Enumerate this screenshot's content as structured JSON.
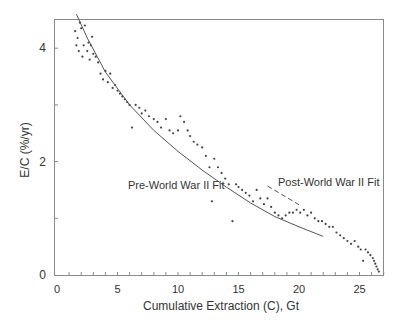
{
  "chart_data": {
    "type": "scatter",
    "title": "",
    "xlabel": "Cumulative Extraction (C), Gt",
    "ylabel": "E/C (%/yr)",
    "xlim": [
      0,
      27.3
    ],
    "ylim": [
      0,
      4.5
    ],
    "x_ticks": [
      0,
      5,
      10,
      15,
      20,
      25
    ],
    "x_tick_labels": [
      "0",
      "5",
      "10",
      "15",
      "20",
      "25"
    ],
    "y_ticks": [
      0,
      2,
      4
    ],
    "y_tick_labels": [
      "0",
      "2",
      "4"
    ],
    "grid": false,
    "legend": null,
    "annotations": [
      {
        "text": "Pre-World War II Fit",
        "x": 11.5,
        "y": 1.97
      },
      {
        "text": "Post-World War II Fit",
        "x": 21.0,
        "y": 1.55
      }
    ],
    "series": [
      {
        "name": "Observed E/C",
        "kind": "scatter",
        "points": [
          [
            1.5,
            4.3
          ],
          [
            1.6,
            4.05
          ],
          [
            1.7,
            4.18
          ],
          [
            1.8,
            3.95
          ],
          [
            1.9,
            4.45
          ],
          [
            2.0,
            4.35
          ],
          [
            2.1,
            3.85
          ],
          [
            2.2,
            4.05
          ],
          [
            2.3,
            4.4
          ],
          [
            2.5,
            3.95
          ],
          [
            2.6,
            4.1
          ],
          [
            2.7,
            3.8
          ],
          [
            2.8,
            4.05
          ],
          [
            2.9,
            4.2
          ],
          [
            3.0,
            3.9
          ],
          [
            3.2,
            3.85
          ],
          [
            3.4,
            3.75
          ],
          [
            3.6,
            3.55
          ],
          [
            3.8,
            3.45
          ],
          [
            4.0,
            3.6
          ],
          [
            4.2,
            3.4
          ],
          [
            4.4,
            3.55
          ],
          [
            4.6,
            3.3
          ],
          [
            4.8,
            3.35
          ],
          [
            5.0,
            3.25
          ],
          [
            5.2,
            3.2
          ],
          [
            5.4,
            3.15
          ],
          [
            5.6,
            3.1
          ],
          [
            5.8,
            3.05
          ],
          [
            6.0,
            3.0
          ],
          [
            6.2,
            2.6
          ],
          [
            6.5,
            3.0
          ],
          [
            6.8,
            2.95
          ],
          [
            7.0,
            2.85
          ],
          [
            7.3,
            2.9
          ],
          [
            7.6,
            2.8
          ],
          [
            8.0,
            2.75
          ],
          [
            8.3,
            2.7
          ],
          [
            8.6,
            2.6
          ],
          [
            9.0,
            2.75
          ],
          [
            9.3,
            2.55
          ],
          [
            9.6,
            2.5
          ],
          [
            10.0,
            2.55
          ],
          [
            10.2,
            2.8
          ],
          [
            10.5,
            2.7
          ],
          [
            10.8,
            2.55
          ],
          [
            11.0,
            2.45
          ],
          [
            11.3,
            2.35
          ],
          [
            11.6,
            2.3
          ],
          [
            12.0,
            2.25
          ],
          [
            12.3,
            2.1
          ],
          [
            12.6,
            1.9
          ],
          [
            12.8,
            1.3
          ],
          [
            13.0,
            2.05
          ],
          [
            13.3,
            1.9
          ],
          [
            13.6,
            1.8
          ],
          [
            13.9,
            1.7
          ],
          [
            14.2,
            1.6
          ],
          [
            14.5,
            0.95
          ],
          [
            14.8,
            1.6
          ],
          [
            15.0,
            1.55
          ],
          [
            15.3,
            1.5
          ],
          [
            15.6,
            1.45
          ],
          [
            15.9,
            1.4
          ],
          [
            16.2,
            1.3
          ],
          [
            16.5,
            1.5
          ],
          [
            16.8,
            1.35
          ],
          [
            17.1,
            1.25
          ],
          [
            17.4,
            1.35
          ],
          [
            17.7,
            1.2
          ],
          [
            18.0,
            1.1
          ],
          [
            18.3,
            1.05
          ],
          [
            18.6,
            1.0
          ],
          [
            18.9,
            1.05
          ],
          [
            19.2,
            1.1
          ],
          [
            19.5,
            1.1
          ],
          [
            19.8,
            1.15
          ],
          [
            20.1,
            1.1
          ],
          [
            20.4,
            1.15
          ],
          [
            20.7,
            1.05
          ],
          [
            21.0,
            1.1
          ],
          [
            21.3,
            1.0
          ],
          [
            21.6,
            0.95
          ],
          [
            21.9,
            0.95
          ],
          [
            22.2,
            0.9
          ],
          [
            22.5,
            0.85
          ],
          [
            22.8,
            0.85
          ],
          [
            23.1,
            0.75
          ],
          [
            23.4,
            0.7
          ],
          [
            23.7,
            0.65
          ],
          [
            24.0,
            0.6
          ],
          [
            24.3,
            0.55
          ],
          [
            24.6,
            0.6
          ],
          [
            24.9,
            0.5
          ],
          [
            25.1,
            0.45
          ],
          [
            25.3,
            0.25
          ],
          [
            25.5,
            0.45
          ],
          [
            25.7,
            0.4
          ],
          [
            25.9,
            0.35
          ],
          [
            26.1,
            0.3
          ],
          [
            26.2,
            0.25
          ],
          [
            26.3,
            0.2
          ],
          [
            26.4,
            0.15
          ],
          [
            26.5,
            0.1
          ],
          [
            26.6,
            0.06
          ]
        ]
      },
      {
        "name": "Pre-World War II Fit",
        "kind": "line",
        "style": "solid",
        "points": [
          [
            1.6,
            4.6
          ],
          [
            2.5,
            4.18
          ],
          [
            4,
            3.58
          ],
          [
            6,
            3.0
          ],
          [
            8,
            2.55
          ],
          [
            10,
            2.18
          ],
          [
            12,
            1.85
          ],
          [
            14,
            1.55
          ],
          [
            16,
            1.27
          ],
          [
            18,
            1.03
          ],
          [
            20,
            0.85
          ],
          [
            22,
            0.68
          ]
        ]
      },
      {
        "name": "Post-World War II Fit",
        "kind": "line",
        "style": "dashed",
        "points": [
          [
            17.4,
            1.57
          ],
          [
            20.0,
            1.24
          ]
        ]
      }
    ]
  }
}
